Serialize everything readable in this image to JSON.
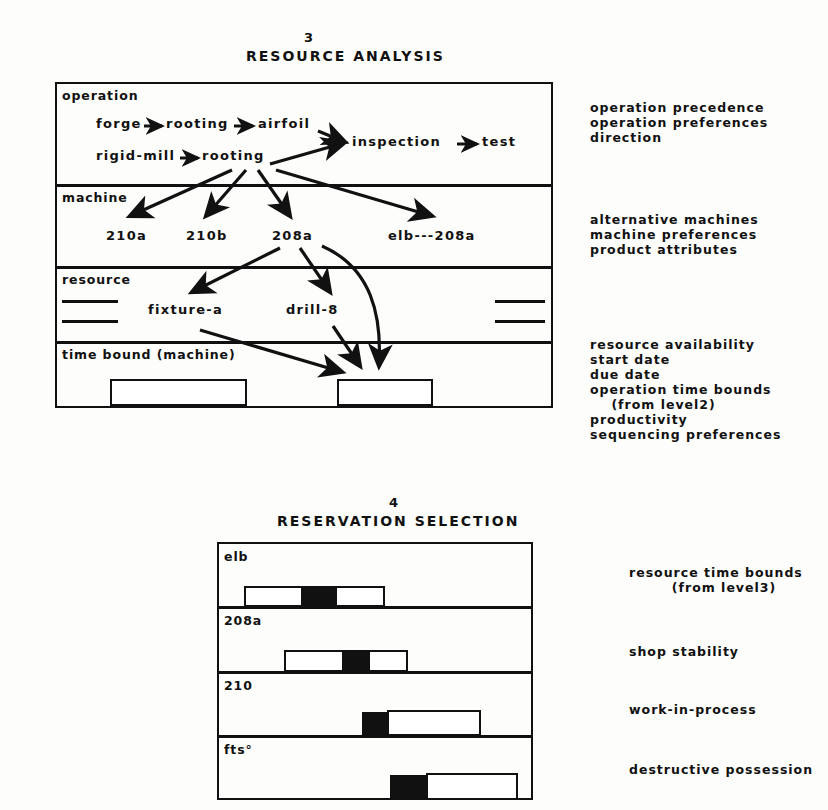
{
  "figure3": {
    "number": "3",
    "title": "RESOURCE ANALYSIS",
    "rows": [
      {
        "label": "operation",
        "nodes": [
          {
            "text": "forge"
          },
          {
            "text": "rooting"
          },
          {
            "text": "airfoil"
          },
          {
            "text": "rigid-mill"
          },
          {
            "text": "rooting"
          },
          {
            "text": "inspection"
          },
          {
            "text": "test"
          }
        ]
      },
      {
        "label": "machine",
        "nodes": [
          {
            "text": "210a"
          },
          {
            "text": "210b"
          },
          {
            "text": "208a"
          },
          {
            "text": "elb---208a"
          }
        ]
      },
      {
        "label": "resource",
        "nodes": [
          {
            "text": "fixture-a"
          },
          {
            "text": "drill-8"
          }
        ]
      },
      {
        "label": "time bound (machine)",
        "nodes": []
      }
    ],
    "annotations": [
      {
        "lines": [
          "operation precedence",
          "operation preferences",
          "direction"
        ]
      },
      {
        "lines": [
          "alternative machines",
          "machine preferences",
          "product attributes"
        ]
      },
      {
        "lines": [
          "resource availability",
          "start date",
          "due date",
          "operation time bounds",
          "    (from level2)",
          "productivity",
          "sequencing preferences"
        ]
      }
    ]
  },
  "figure4": {
    "number": "4",
    "title": "RESERVATION SELECTION",
    "rows": [
      {
        "label": "elb",
        "annotation": [
          "resource time bounds",
          "        (from level3)"
        ]
      },
      {
        "label": "208a",
        "annotation": [
          "shop stability"
        ]
      },
      {
        "label": "210",
        "annotation": [
          "work-in-process"
        ]
      },
      {
        "label": "fts°",
        "annotation": [
          "destructive possession"
        ]
      }
    ]
  },
  "colors": {
    "ink": "#111111",
    "paper": "#fdfdfb"
  }
}
